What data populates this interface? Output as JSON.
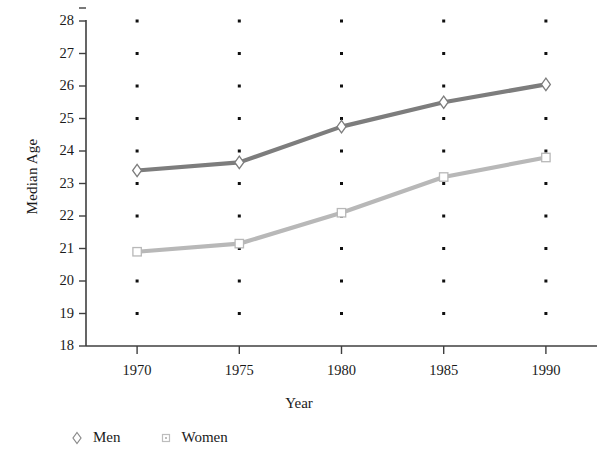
{
  "chart_data": {
    "type": "line",
    "title": "",
    "xlabel": "Year",
    "ylabel": "Median Age",
    "categories": [
      1970,
      1975,
      1980,
      1985,
      1990
    ],
    "x": [
      1970,
      1975,
      1980,
      1985,
      1990
    ],
    "xtick_labels": [
      "1970",
      "1975",
      "1980",
      "1985",
      "1990"
    ],
    "ytick_labels": [
      "18",
      "19",
      "20",
      "21",
      "22",
      "23",
      "24",
      "25",
      "26",
      "27",
      "28"
    ],
    "yticks": [
      18,
      19,
      20,
      21,
      22,
      23,
      24,
      25,
      26,
      27,
      28
    ],
    "xlim": [
      1967.5,
      1992.5
    ],
    "ylim": [
      18,
      28
    ],
    "grid": "dot-matrix",
    "legend_position": "below-left",
    "series": [
      {
        "name": "Men",
        "marker": "diamond",
        "color": "#7d7d7d",
        "values": [
          23.4,
          23.65,
          24.75,
          25.5,
          26.05
        ]
      },
      {
        "name": "Women",
        "marker": "square",
        "color": "#b8b8b8",
        "values": [
          20.9,
          21.15,
          22.1,
          23.2,
          23.8
        ]
      }
    ]
  },
  "axes": {
    "y_title": "Median Age",
    "x_title": "Year"
  },
  "legend": {
    "items": [
      {
        "label": "Men",
        "marker": "diamond-marker",
        "color": "#8a8a8a"
      },
      {
        "label": "Women",
        "marker": "square-marker",
        "color": "#bdbdbd"
      }
    ]
  },
  "colors": {
    "axis": "#3f3f3f",
    "grid_dot": "#101010",
    "men_line": "#7d7d7d",
    "women_line": "#b8b8b8",
    "text": "#1a1a1a",
    "background": "#ffffff"
  }
}
